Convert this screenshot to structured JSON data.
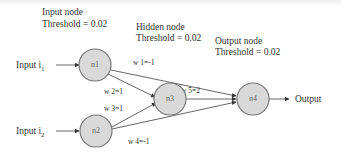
{
  "annotations": {
    "input_node": {
      "title": "Input node",
      "threshold": "Threshold = 0.02"
    },
    "hidden_node": {
      "title": "Hidden node",
      "threshold": "Threshold = 0.02"
    },
    "output_node": {
      "title": "Output node",
      "threshold": "Threshold = 0.02"
    }
  },
  "inputs": [
    {
      "label": "Input i",
      "subscript": "1"
    },
    {
      "label": "Input i",
      "subscript": "2"
    }
  ],
  "nodes": [
    {
      "id": "n1",
      "label": "n1"
    },
    {
      "id": "n2",
      "label": "n2"
    },
    {
      "id": "n3",
      "label": "n3"
    },
    {
      "id": "n4",
      "label": "n4"
    }
  ],
  "weights": {
    "w1": "w 1=-1",
    "w2": "w 2=1",
    "w3": "w 3=1",
    "w4": "w 4=-1",
    "w5": "w 5=2"
  },
  "output": {
    "label": "Output"
  },
  "colors": {
    "node_fill": "#d9d9d9",
    "node_stroke": "#777777",
    "edge": "#555555"
  }
}
